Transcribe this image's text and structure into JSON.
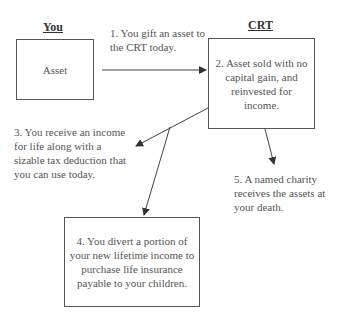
{
  "headers": {
    "left": "You",
    "right": "CRT"
  },
  "boxes": {
    "asset": "Asset",
    "crt": "2. Asset sold with no capital gain, and reinvested for income.",
    "insurance": "4. You divert a portion of your new lifetime income to purchase life insurance payable to your children."
  },
  "labels": {
    "step1": "1. You gift an asset to the CRT today.",
    "step3": "3. You receive an income for life along with a sizable tax deduction that you can use today.",
    "step5": "5. A named charity receives the assets at your death."
  },
  "colors": {
    "line": "#444444",
    "text": "#555555"
  }
}
